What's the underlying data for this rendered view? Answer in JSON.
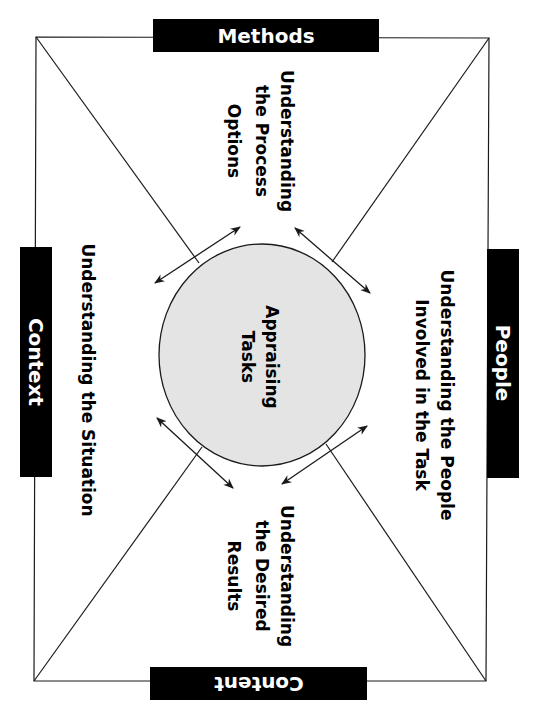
{
  "labels": {
    "top": "Methods",
    "right": "People",
    "bottom": "Content",
    "left": "Context"
  },
  "center": {
    "line1": "Appraising",
    "line2": "Tasks"
  },
  "quadrants": {
    "top": [
      "Understanding",
      "the Process",
      "Options"
    ],
    "right": [
      "Understanding the People",
      "Involved in the Task"
    ],
    "bottom": [
      "Understanding",
      "the Desired",
      "Results"
    ],
    "left": [
      "Understanding the Situation"
    ]
  },
  "colors": {
    "label_fill": "#000000",
    "label_text": "#ffffff",
    "circle_fill": "#e4e4e4",
    "stroke": "#1a1a1a"
  }
}
